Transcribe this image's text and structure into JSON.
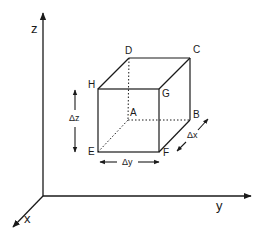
{
  "diagram": {
    "axes": {
      "origin": [
        43,
        196
      ],
      "z": {
        "label": "z",
        "end": [
          43,
          12
        ]
      },
      "y": {
        "label": "y",
        "end": [
          252,
          196
        ]
      },
      "x": {
        "label": "x",
        "end": [
          12,
          228
        ]
      }
    },
    "vertices": {
      "A": {
        "label": "A",
        "pt": [
          128,
          120
        ]
      },
      "B": {
        "label": "B",
        "pt": [
          190,
          120
        ]
      },
      "C": {
        "label": "C",
        "pt": [
          190,
          58
        ]
      },
      "D": {
        "label": "D",
        "pt": [
          129,
          58
        ]
      },
      "E": {
        "label": "E",
        "pt": [
          98,
          152
        ]
      },
      "F": {
        "label": "F",
        "pt": [
          159,
          152
        ]
      },
      "G": {
        "label": "G",
        "pt": [
          159,
          89
        ]
      },
      "H": {
        "label": "H",
        "pt": [
          98,
          89
        ]
      }
    },
    "dimensions": {
      "dz": {
        "label": "Δz"
      },
      "dy": {
        "label": "Δy"
      },
      "dx": {
        "label": "Δx"
      }
    },
    "colors": {
      "line": "#1a1a1a",
      "background": "#ffffff"
    }
  }
}
